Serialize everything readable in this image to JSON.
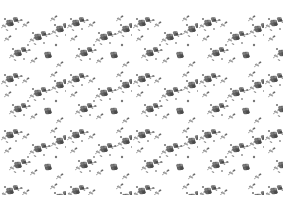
{
  "image": {
    "description": "Grayscale scattered floral wallpaper pattern of small roses and leafy sprigs on white background",
    "background_color": "#ffffff",
    "ink_color": "#6e6e6e",
    "dark_ink_color": "#4a4a4a",
    "light_ink_color": "#a8a8a8"
  }
}
